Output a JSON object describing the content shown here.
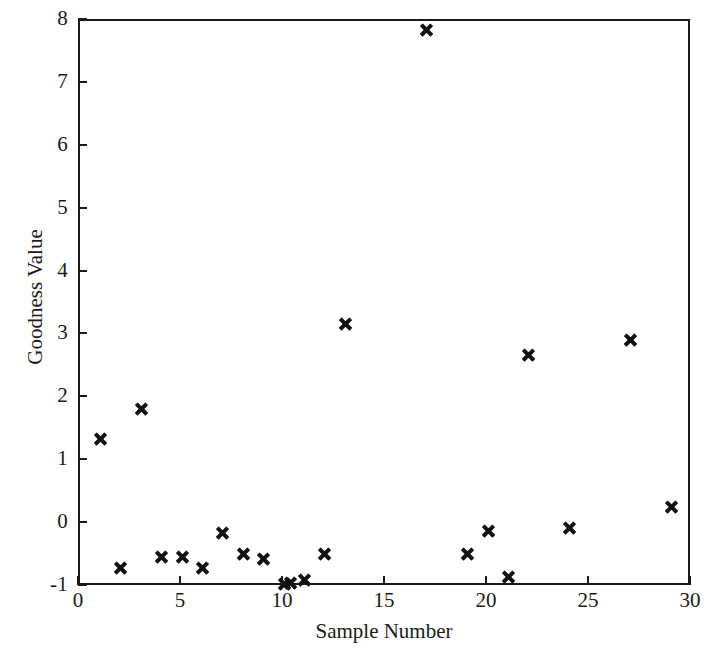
{
  "chart_data": {
    "type": "scatter",
    "title": "",
    "xlabel": "Sample Number",
    "ylabel": "Goodness Value",
    "xlim": [
      0,
      30
    ],
    "ylim": [
      -1,
      8
    ],
    "xticks": [
      0,
      5,
      10,
      15,
      20,
      25,
      30
    ],
    "yticks": [
      -1,
      0,
      1,
      2,
      3,
      4,
      5,
      6,
      7,
      8
    ],
    "xtick_labels": [
      "0",
      "5",
      "10",
      "15",
      "20",
      "25",
      "30"
    ],
    "ytick_labels": [
      "-1",
      "0",
      "1",
      "2",
      "3",
      "4",
      "5",
      "6",
      "7",
      "8"
    ],
    "grid": false,
    "legend": null,
    "marker": "x",
    "marker_color": "#111111",
    "series": [
      {
        "name": "Goodness Value",
        "x": [
          1,
          2,
          3,
          4,
          5,
          6,
          7,
          8,
          9,
          10,
          10.3,
          11,
          12,
          13,
          17,
          19,
          20,
          21,
          22,
          24,
          27,
          29
        ],
        "y": [
          1.35,
          -0.7,
          1.83,
          -0.52,
          -0.52,
          -0.7,
          -0.14,
          -0.47,
          -0.55,
          -0.95,
          -0.93,
          -0.89,
          -0.47,
          3.18,
          7.85,
          -0.47,
          -0.11,
          -0.85,
          2.68,
          -0.06,
          2.93,
          0.27
        ]
      }
    ],
    "points": [
      {
        "x": 1,
        "y": 1.35
      },
      {
        "x": 2,
        "y": -0.7
      },
      {
        "x": 3,
        "y": 1.83
      },
      {
        "x": 4,
        "y": -0.52
      },
      {
        "x": 5,
        "y": -0.52
      },
      {
        "x": 6,
        "y": -0.7
      },
      {
        "x": 7,
        "y": -0.14
      },
      {
        "x": 8,
        "y": -0.47
      },
      {
        "x": 9,
        "y": -0.55
      },
      {
        "x": 10,
        "y": -0.95
      },
      {
        "x": 10.3,
        "y": -0.93
      },
      {
        "x": 11,
        "y": -0.89
      },
      {
        "x": 12,
        "y": -0.47
      },
      {
        "x": 13,
        "y": 3.18
      },
      {
        "x": 17,
        "y": 7.85
      },
      {
        "x": 19,
        "y": -0.47
      },
      {
        "x": 20,
        "y": -0.11
      },
      {
        "x": 21,
        "y": -0.85
      },
      {
        "x": 22,
        "y": 2.68
      },
      {
        "x": 24,
        "y": -0.06
      },
      {
        "x": 27,
        "y": 2.93
      },
      {
        "x": 29,
        "y": 0.27
      }
    ]
  },
  "axes": {
    "x_title": "Sample Number",
    "y_title": "Goodness Value"
  }
}
